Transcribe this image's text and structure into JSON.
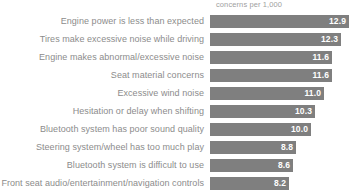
{
  "chart_data": {
    "type": "bar",
    "orientation": "horizontal",
    "title": "",
    "subtitle": "",
    "xlabel": "concerns per 1,000",
    "ylabel": "",
    "grid": false,
    "legend": null,
    "axis_header": "concerns per 1,000",
    "value_label_position": "inside-end",
    "bar_color": "#7f7f7f",
    "label_color": "#8c8c8c",
    "value_text_color": "#ffffff",
    "background_color": "#ffffff",
    "xlim": [
      0,
      13.5
    ],
    "bar_scale_note": "bar pixel length is not proportional from zero origin",
    "categories": [
      "Engine power is less than expected",
      "Tires make excessive noise while driving",
      "Engine makes abnormal/excessive noise",
      "Seat material concerns",
      "Excessive wind noise",
      "Hesitation or delay when shifting",
      "Bluetooth system has poor sound quality",
      "Steering system/wheel has too much play",
      "Bluetooth system is difficult to use",
      "Front seat audio/entertainment/navigation controls"
    ],
    "values": [
      12.9,
      12.3,
      11.6,
      11.6,
      11.0,
      10.3,
      10.0,
      8.8,
      8.6,
      8.2
    ],
    "value_labels": [
      "12.9",
      "12.3",
      "11.6",
      "11.6",
      "11.0",
      "10.3",
      "10.0",
      "8.8",
      "8.6",
      "8.2"
    ],
    "bar_widths_px": [
      139,
      131,
      122,
      122,
      114,
      105,
      101,
      86,
      83,
      79
    ],
    "rows": [
      {
        "label": "Engine power is less than expected",
        "value": 12.9,
        "value_label": "12.9",
        "width_px": 139
      },
      {
        "label": "Tires make excessive noise while driving",
        "value": 12.3,
        "value_label": "12.3",
        "width_px": 131
      },
      {
        "label": "Engine makes abnormal/excessive noise",
        "value": 11.6,
        "value_label": "11.6",
        "width_px": 122
      },
      {
        "label": "Seat material concerns",
        "value": 11.6,
        "value_label": "11.6",
        "width_px": 122
      },
      {
        "label": "Excessive wind noise",
        "value": 11.0,
        "value_label": "11.0",
        "width_px": 114
      },
      {
        "label": "Hesitation or delay when shifting",
        "value": 10.3,
        "value_label": "10.3",
        "width_px": 105
      },
      {
        "label": "Bluetooth system has poor sound quality",
        "value": 10.0,
        "value_label": "10.0",
        "width_px": 101
      },
      {
        "label": "Steering system/wheel has too much play",
        "value": 8.8,
        "value_label": "8.8",
        "width_px": 86
      },
      {
        "label": "Bluetooth system is difficult to use",
        "value": 8.6,
        "value_label": "8.6",
        "width_px": 83
      },
      {
        "label": "Front seat audio/entertainment/navigation controls",
        "value": 8.2,
        "value_label": "8.2",
        "width_px": 79
      }
    ]
  }
}
